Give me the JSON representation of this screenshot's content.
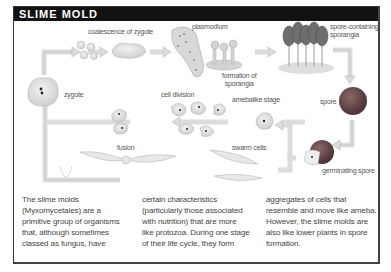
{
  "title": "SLIME MOLD",
  "stages": {
    "coalescence": "coalescence of zygote",
    "plasmodium": "plasmodium",
    "formation": "formation of sporangia",
    "sporangia": "spore-containing sporangia",
    "spore": "spore",
    "germinating": "germinating spore",
    "swarm": "swarm cells",
    "amebalike": "amebalike stage",
    "cell_division": "cell division",
    "fusion": "fusion",
    "zygote": "zygote"
  },
  "formation_lines": [
    "formation of",
    "sporangia"
  ],
  "sporangia_lines": [
    "spore-containing",
    "sporangia"
  ],
  "body_columns": [
    [
      "The slime molds",
      "(Myxomycetales) are a",
      "primitive group of organisms",
      "that, although sometimes",
      "classed as fungus, have"
    ],
    [
      "certain characteristics",
      "(particularly those associated",
      "with nutrition) that are more",
      "like protozoa. During one stage",
      "of their life cycle, they form"
    ],
    [
      "aggregates of cells that",
      "resemble and move like ameba.",
      "However, the slime molds are",
      "also like lower plants in spore",
      "formation."
    ]
  ],
  "colors": {
    "header_bg": "#111111",
    "spore": "#6b4a4a",
    "arrow": "#e4e4e4"
  }
}
